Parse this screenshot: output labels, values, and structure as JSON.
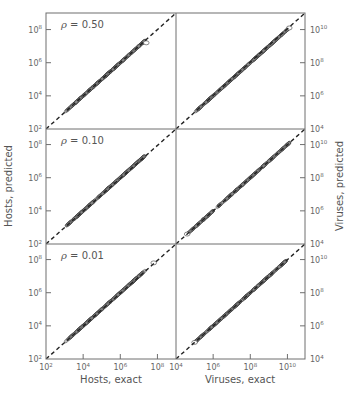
{
  "chart_data": {
    "type": "scatter",
    "layout": "3x2 grid of log-log scatter panels with shared axes",
    "xlabel_left": "Hosts, exact",
    "xlabel_right": "Viruses, exact",
    "ylabel_left": "Hosts, predicted",
    "ylabel_right": "Viruses, predicted",
    "reference_line": "dashed y = x",
    "grid": false,
    "hosts_axis": {
      "scale": "log",
      "range": [
        100,
        1000000000
      ],
      "ticks": [
        "10^2",
        "10^4",
        "10^6",
        "10^8"
      ]
    },
    "viruses_axis": {
      "scale": "log",
      "range": [
        10000,
        100000000000
      ],
      "ticks": [
        "10^4",
        "10^6",
        "10^8",
        "10^10"
      ]
    },
    "panels": [
      {
        "row": 0,
        "col": 0,
        "label": "ρ = 0.50",
        "rho": 0.5,
        "variable": "Hosts",
        "x_range_log10": [
          3.1,
          7.4
        ],
        "deviation": "tight along y=x",
        "outliers_log10": [
          [
            7.4,
            7.2
          ]
        ]
      },
      {
        "row": 0,
        "col": 1,
        "label": "",
        "rho": 0.5,
        "variable": "Viruses",
        "x_range_log10": [
          5.1,
          10.1
        ],
        "deviation": "tight along y=x",
        "outliers_log10": [
          [
            10.1,
            10.1
          ]
        ]
      },
      {
        "row": 1,
        "col": 0,
        "label": "ρ = 0.10",
        "rho": 0.1,
        "variable": "Hosts",
        "x_range_log10": [
          3.1,
          7.3
        ],
        "deviation": "tight along y=x",
        "outliers_log10": []
      },
      {
        "row": 1,
        "col": 1,
        "label": "",
        "rho": 0.1,
        "variable": "Viruses",
        "x_range_log10": [
          4.6,
          10.1
        ],
        "deviation": "tight along y=x, sparse low end",
        "outliers_log10": [
          [
            4.6,
            4.6
          ]
        ]
      },
      {
        "row": 2,
        "col": 0,
        "label": "ρ = 0.01",
        "rho": 0.01,
        "variable": "Hosts",
        "x_range_log10": [
          3.1,
          7.3
        ],
        "deviation": "tight along y=x",
        "outliers_log10": [
          [
            7.8,
            7.8
          ]
        ]
      },
      {
        "row": 2,
        "col": 1,
        "label": "",
        "rho": 0.01,
        "variable": "Viruses",
        "x_range_log10": [
          5.0,
          9.9
        ],
        "deviation": "tight along y=x",
        "outliers_log10": [
          [
            5.0,
            5.0
          ]
        ]
      }
    ]
  },
  "labels": {
    "xlabel_left": "Hosts, exact",
    "xlabel_right": "Viruses, exact",
    "ylabel_left": "Hosts, predicted",
    "ylabel_right": "Viruses, predicted",
    "rho_symbol": "ρ",
    "rho_values": [
      " = 0.50",
      " = 0.10",
      " = 0.01"
    ]
  },
  "ticks": {
    "hosts": [
      {
        "base": "10",
        "exp": "2"
      },
      {
        "base": "10",
        "exp": "4"
      },
      {
        "base": "10",
        "exp": "6"
      },
      {
        "base": "10",
        "exp": "8"
      }
    ],
    "viruses": [
      {
        "base": "10",
        "exp": "4"
      },
      {
        "base": "10",
        "exp": "6"
      },
      {
        "base": "10",
        "exp": "8"
      },
      {
        "base": "10",
        "exp": "10"
      }
    ]
  },
  "colors": {
    "frame": "#6e6e6e",
    "points_fill": "#8a8a8a",
    "points_stroke": "#3a3a3a",
    "dashed_line": "#222222",
    "text": "#555555"
  }
}
